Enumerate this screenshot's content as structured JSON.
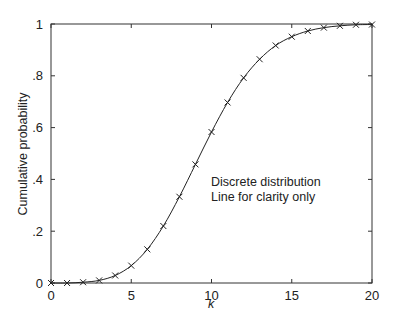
{
  "chart_data": {
    "type": "line",
    "title": "",
    "xlabel": "k",
    "ylabel": "Cumulative probability",
    "xlim": [
      0,
      20
    ],
    "ylim": [
      0,
      1
    ],
    "x_ticks": [
      0,
      5,
      10,
      15,
      20
    ],
    "x_tick_labels": [
      "0",
      "5",
      "10",
      "15",
      "20"
    ],
    "y_ticks": [
      0,
      0.2,
      0.4,
      0.6,
      0.8,
      1
    ],
    "y_tick_labels": [
      "0",
      ".2",
      ".4",
      ".6",
      ".8",
      "1"
    ],
    "grid": false,
    "marker": "x",
    "series": [
      {
        "name": "Cumulative probability",
        "x": [
          0,
          1,
          2,
          3,
          4,
          5,
          6,
          7,
          8,
          9,
          10,
          11,
          12,
          13,
          14,
          15,
          16,
          17,
          18,
          19,
          20
        ],
        "values": [
          0.0,
          0.0,
          0.003,
          0.01,
          0.029,
          0.067,
          0.13,
          0.22,
          0.333,
          0.458,
          0.583,
          0.697,
          0.792,
          0.864,
          0.917,
          0.951,
          0.973,
          0.986,
          0.993,
          0.997,
          0.998
        ]
      }
    ],
    "annotations": [
      "Discrete distribution",
      "Line for clarity only"
    ]
  },
  "colors": {
    "line": "#222222",
    "axes": "#333333",
    "background": "#ffffff"
  }
}
